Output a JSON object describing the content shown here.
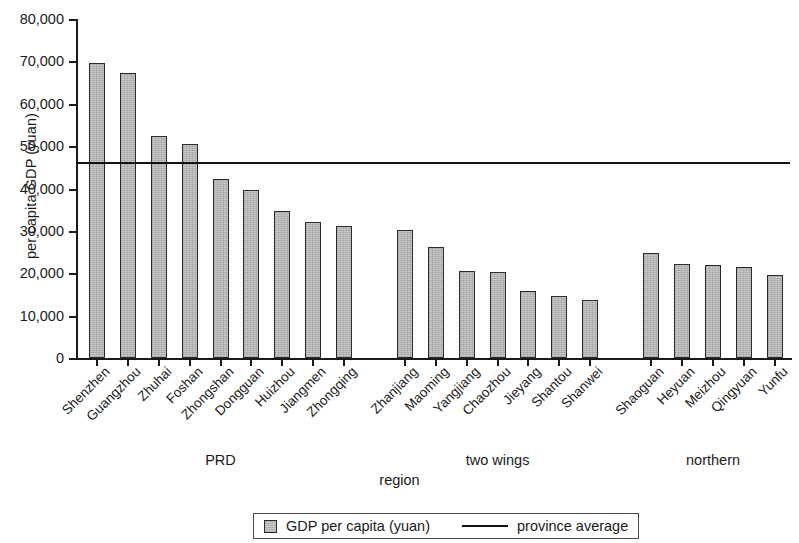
{
  "chart_data": {
    "type": "bar",
    "title": "",
    "xlabel": "region",
    "ylabel": "per capita GDP (yuan)",
    "ylim": [
      0,
      80000
    ],
    "ytick_values": [
      0,
      10000,
      20000,
      30000,
      40000,
      50000,
      60000,
      70000,
      80000
    ],
    "ytick_labels": [
      "0",
      "10,000",
      "20,000",
      "30,000",
      "40,000",
      "50,000",
      "60,000",
      "70,000",
      "80,000"
    ],
    "grid": false,
    "legend_position": "bottom",
    "categories": [
      "Shenzhen",
      "Guangzhou",
      "Zhuhai",
      "Foshan",
      "Zhongshan",
      "Dongguan",
      "Huizhou",
      "Jiangmen",
      "Zhongqing",
      "Zhanjiang",
      "Maoming",
      "Yangjiang",
      "Chaozhou",
      "Jieyang",
      "Shantou",
      "Shanwei",
      "Shaoguan",
      "Heyuan",
      "Meizhou",
      "Qingyuan",
      "Yunfu"
    ],
    "values": [
      69700,
      67300,
      52300,
      50500,
      42300,
      39600,
      34600,
      32000,
      31100,
      30300,
      26100,
      20500,
      20400,
      15800,
      14700,
      13700,
      24900,
      22300,
      21900,
      21500,
      19700
    ],
    "series": [
      {
        "name": "GDP per capita (yuan)",
        "type": "bar",
        "color": "#c9c9c9",
        "values": [
          69700,
          67300,
          52300,
          50500,
          42300,
          39600,
          34600,
          32000,
          31100,
          30300,
          26100,
          20500,
          20400,
          15800,
          14700,
          13700,
          24900,
          22300,
          21900,
          21500,
          19700
        ]
      },
      {
        "name": "province average",
        "type": "hline",
        "color": "#111111",
        "value": 46000
      }
    ],
    "groups": [
      {
        "label": "PRD",
        "start_index": 0,
        "end_index": 8
      },
      {
        "label": "two wings",
        "start_index": 9,
        "end_index": 15
      },
      {
        "label": "northern",
        "start_index": 16,
        "end_index": 20
      }
    ],
    "legend": [
      {
        "label": "GDP per capita (yuan)",
        "marker": "square-swatch"
      },
      {
        "label": "province average",
        "marker": "line"
      }
    ]
  }
}
